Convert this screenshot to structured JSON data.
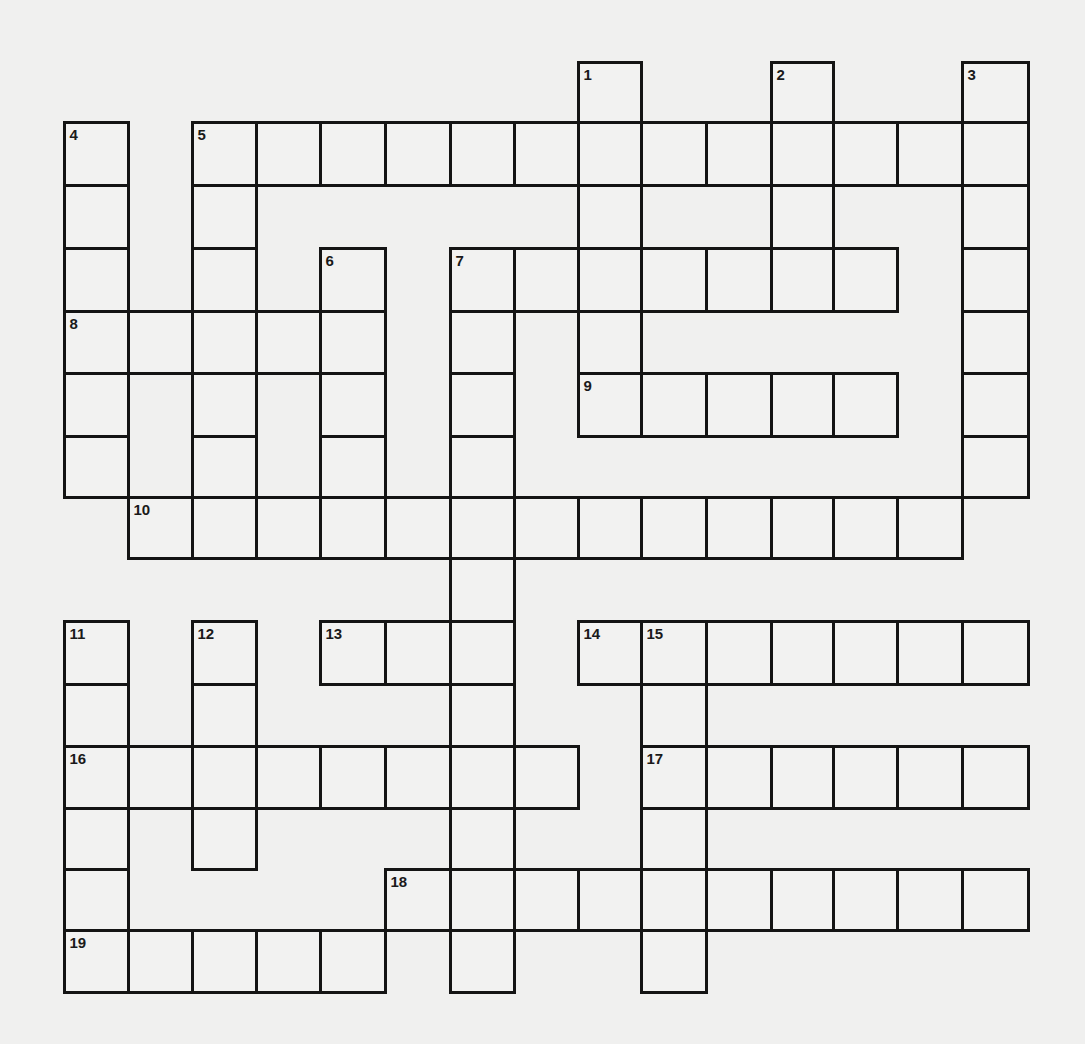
{
  "puzzle": {
    "type": "crossword",
    "rows": 15,
    "cols": 15,
    "grid_origin": {
      "x": 64,
      "y": 62
    },
    "col_edges": [
      64,
      128,
      192,
      256,
      320,
      385,
      450,
      514,
      578,
      641,
      706,
      771,
      833,
      897,
      962,
      1028
    ],
    "row_edges": [
      62,
      122,
      185,
      248,
      311,
      373,
      436,
      497,
      558,
      621,
      684,
      746,
      808,
      869,
      930,
      992
    ],
    "cells": {
      "0": [
        8,
        11,
        14
      ],
      "1": [
        0,
        2,
        3,
        4,
        5,
        6,
        7,
        8,
        9,
        10,
        11,
        12,
        13,
        14
      ],
      "2": [
        0,
        2,
        8,
        11,
        14
      ],
      "3": [
        0,
        2,
        4,
        6,
        7,
        8,
        9,
        10,
        11,
        12,
        14
      ],
      "4": [
        0,
        1,
        2,
        3,
        4,
        6,
        8,
        14
      ],
      "5": [
        0,
        2,
        4,
        6,
        8,
        9,
        10,
        11,
        12,
        14
      ],
      "6": [
        0,
        2,
        4,
        6,
        14
      ],
      "7": [
        1,
        2,
        3,
        4,
        5,
        6,
        7,
        8,
        9,
        10,
        11,
        12,
        13
      ],
      "8": [
        6
      ],
      "9": [
        0,
        2,
        4,
        5,
        6,
        8,
        9,
        10,
        11,
        12,
        13,
        14
      ],
      "10": [
        0,
        2,
        6,
        9
      ],
      "11": [
        0,
        1,
        2,
        3,
        4,
        5,
        6,
        7,
        9,
        10,
        11,
        12,
        13,
        14
      ],
      "12": [
        0,
        2,
        6,
        9
      ],
      "13": [
        0,
        5,
        6,
        7,
        8,
        9,
        10,
        11,
        12,
        13,
        14
      ],
      "14": [
        0,
        1,
        2,
        3,
        4,
        6,
        9
      ]
    },
    "numbers": [
      {
        "n": "1",
        "r": 0,
        "c": 8
      },
      {
        "n": "2",
        "r": 0,
        "c": 11
      },
      {
        "n": "3",
        "r": 0,
        "c": 14
      },
      {
        "n": "4",
        "r": 1,
        "c": 0
      },
      {
        "n": "5",
        "r": 1,
        "c": 2
      },
      {
        "n": "6",
        "r": 3,
        "c": 4
      },
      {
        "n": "7",
        "r": 3,
        "c": 6
      },
      {
        "n": "8",
        "r": 4,
        "c": 0
      },
      {
        "n": "9",
        "r": 5,
        "c": 8
      },
      {
        "n": "10",
        "r": 7,
        "c": 1
      },
      {
        "n": "11",
        "r": 9,
        "c": 0
      },
      {
        "n": "12",
        "r": 9,
        "c": 2
      },
      {
        "n": "13",
        "r": 9,
        "c": 4
      },
      {
        "n": "14",
        "r": 9,
        "c": 8
      },
      {
        "n": "15",
        "r": 9,
        "c": 9
      },
      {
        "n": "16",
        "r": 11,
        "c": 0
      },
      {
        "n": "17",
        "r": 11,
        "c": 9
      },
      {
        "n": "18",
        "r": 13,
        "c": 5
      },
      {
        "n": "19",
        "r": 14,
        "c": 0
      }
    ],
    "entries": {
      "across": [
        {
          "n": "5",
          "length": 13
        },
        {
          "n": "7",
          "length": 7
        },
        {
          "n": "8",
          "length": 5
        },
        {
          "n": "9",
          "length": 5
        },
        {
          "n": "10",
          "length": 13
        },
        {
          "n": "13",
          "length": 3
        },
        {
          "n": "14",
          "length": 7
        },
        {
          "n": "16",
          "length": 8
        },
        {
          "n": "17",
          "length": 6
        },
        {
          "n": "18",
          "length": 10
        },
        {
          "n": "19",
          "length": 5
        }
      ],
      "down": [
        {
          "n": "1",
          "length": 6
        },
        {
          "n": "2",
          "length": 4
        },
        {
          "n": "3",
          "length": 7
        },
        {
          "n": "4",
          "length": 6
        },
        {
          "n": "5",
          "length": 7
        },
        {
          "n": "6",
          "length": 5
        },
        {
          "n": "7",
          "length": 12
        },
        {
          "n": "11",
          "length": 6
        },
        {
          "n": "12",
          "length": 4
        },
        {
          "n": "15",
          "length": 6
        }
      ]
    },
    "colors": {
      "background": "#f0f0ef",
      "cell_fill": "#f2f2f1",
      "border": "#141414",
      "number": "#1a1a1a"
    }
  }
}
